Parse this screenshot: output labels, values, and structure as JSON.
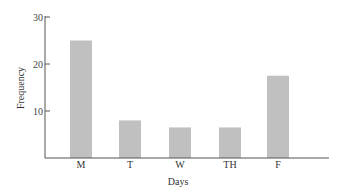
{
  "chart_data": {
    "type": "bar",
    "title": "",
    "xlabel": "Days",
    "ylabel": "Frequency",
    "categories": [
      "M",
      "T",
      "W",
      "TH",
      "F"
    ],
    "values": [
      25,
      8,
      6.5,
      6.5,
      17.5
    ],
    "ylim": [
      0,
      30
    ],
    "yticks": [
      10,
      20,
      30
    ],
    "grid": false,
    "legend": null,
    "colors": {
      "bar": "#c0c0c0",
      "axis": "#555555"
    }
  }
}
